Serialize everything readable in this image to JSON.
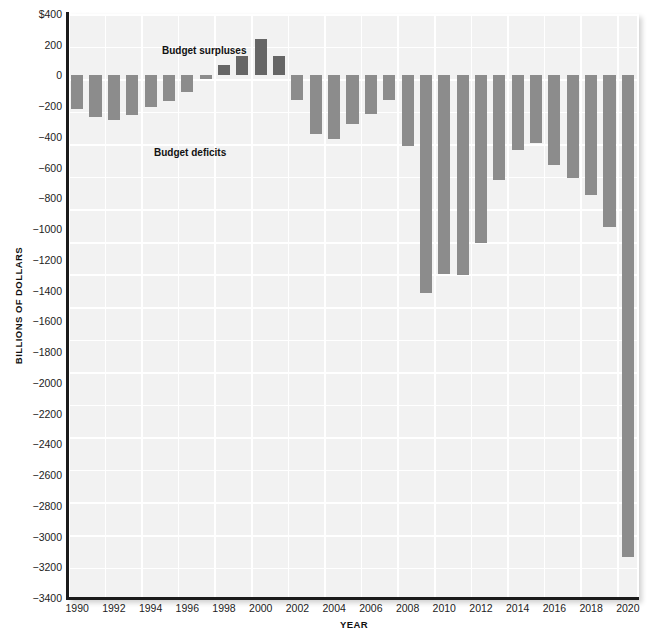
{
  "chart": {
    "type": "bar",
    "title": "",
    "ylabel": "BILLIONS OF DOLLARS",
    "xlabel": "YEAR",
    "annotations": {
      "surplus": "Budget surpluses",
      "deficit": "Budget deficits"
    },
    "colors": {
      "bar": "#8c8c8c",
      "bar_positive": "#666666",
      "plot_background": "#f2f2f2",
      "gridline": "#ffffff",
      "axis": "#1b1b1b",
      "text": "#1c1c1c"
    }
  },
  "chart_data": {
    "type": "bar",
    "title": "",
    "xlabel": "YEAR",
    "ylabel": "BILLIONS OF DOLLARS",
    "ylim": [
      -3400,
      400
    ],
    "xlim": [
      1989.5,
      2020.5
    ],
    "grid": true,
    "legend": "none",
    "ytick_labels": [
      "$400",
      "200",
      "0",
      "−200",
      "−400",
      "−600",
      "−800",
      "−1000",
      "−1200",
      "−1400",
      "−1600",
      "−1800",
      "−2000",
      "−2200",
      "−2400",
      "−2600",
      "−2800",
      "−3000",
      "−3200",
      "−3400"
    ],
    "ytick_values": [
      400,
      200,
      0,
      -200,
      -400,
      -600,
      -800,
      -1000,
      -1200,
      -1400,
      -1600,
      -1800,
      -2000,
      -2200,
      -2400,
      -2600,
      -2800,
      -3000,
      -3200,
      -3400
    ],
    "xtick_labels": [
      "1990",
      "1992",
      "1994",
      "1996",
      "1998",
      "2000",
      "2002",
      "2004",
      "2006",
      "2008",
      "2010",
      "2012",
      "2014",
      "2016",
      "2018",
      "2020"
    ],
    "xtick_values": [
      1990,
      1992,
      1994,
      1996,
      1998,
      2000,
      2002,
      2004,
      2006,
      2008,
      2010,
      2012,
      2014,
      2016,
      2018,
      2020
    ],
    "categories": [
      1990,
      1991,
      1992,
      1993,
      1994,
      1995,
      1996,
      1997,
      1998,
      1999,
      2000,
      2001,
      2002,
      2003,
      2004,
      2005,
      2006,
      2007,
      2008,
      2009,
      2010,
      2011,
      2012,
      2013,
      2014,
      2015,
      2016,
      2017,
      2018,
      2019,
      2020
    ],
    "values": [
      -221,
      -269,
      -290,
      -255,
      -203,
      -164,
      -107,
      -22,
      69,
      126,
      236,
      128,
      -158,
      -378,
      -413,
      -318,
      -248,
      -161,
      -459,
      -1413,
      -1294,
      -1300,
      -1087,
      -680,
      -485,
      -438,
      -585,
      -665,
      -779,
      -984,
      -3132
    ],
    "annotations": [
      {
        "text": "Budget surpluses",
        "x": 1992.5,
        "y": 300
      },
      {
        "text": "Budget deficits",
        "x": 1992.0,
        "y": -440
      }
    ]
  }
}
